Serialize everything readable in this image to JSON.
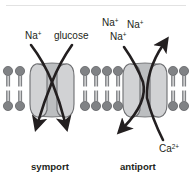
{
  "figure": {
    "background_color": "#ffffff",
    "top_rule_color": "#e2e2e2"
  },
  "colors": {
    "ink": "#231f20",
    "arrow": "#231f20",
    "lipid_head": "#808285",
    "lipid_head_stroke": "#58595b",
    "lipid_tail": "#808285",
    "protein_fill": "#d9d9d9",
    "protein_stroke": "#6d6e71",
    "protein_lobe_fill": "#d1d2d4",
    "channel_fill": "#bcbec0"
  },
  "panels": [
    {
      "id": "symport",
      "caption": "symport",
      "caption_x": 54,
      "caption_y": 168,
      "transported": [
        {
          "name": "Na",
          "charge": "+",
          "label_x": 25,
          "label_y": 39,
          "direction": "inward"
        },
        {
          "name": "glucose",
          "charge": "",
          "label_x": 55,
          "label_y": 39,
          "direction": "inward"
        }
      ]
    },
    {
      "id": "antiport",
      "caption": "antiport",
      "caption_x": 140,
      "caption_y": 168,
      "transported": [
        {
          "name": "Na",
          "charge": "+",
          "label_x": 104,
          "label_y": 25,
          "direction": "inward"
        },
        {
          "name": "Na",
          "charge": "+",
          "label_x": 128,
          "label_y": 27,
          "direction": "inward"
        },
        {
          "name": "Na",
          "charge": "+",
          "label_x": 112,
          "label_y": 39,
          "direction": "inward"
        },
        {
          "name": "Ca",
          "charge": "2+",
          "label_x": 161,
          "label_y": 152,
          "direction": "outward"
        }
      ]
    }
  ],
  "labels": {
    "na_symport": "Na",
    "na_symport_charge": "+",
    "glucose": "glucose",
    "na_anti_1": "Na",
    "na_anti_1_charge": "+",
    "na_anti_2": "Na",
    "na_anti_2_charge": "+",
    "na_anti_3": "Na",
    "na_anti_3_charge": "+",
    "ca": "Ca",
    "ca_charge": "2+",
    "symport_caption": "symport",
    "antiport_caption": "antiport"
  },
  "membrane": {
    "top_head_y": 68,
    "bottom_head_y": 105,
    "segments": [
      {
        "id": "left",
        "x_positions": [
          7,
          19
        ],
        "count": 2
      },
      {
        "id": "middle",
        "x_positions": [
          85,
          96,
          107,
          118
        ],
        "count": 4
      },
      {
        "id": "right",
        "x_positions": [
          173,
          184
        ],
        "count": 2
      }
    ]
  },
  "proteins": [
    {
      "id": "symport-transporter",
      "center_x": 52,
      "top_y": 62,
      "bottom_y": 118
    },
    {
      "id": "antiport-transporter",
      "center_x": 145,
      "top_y": 62,
      "bottom_y": 118
    }
  ]
}
